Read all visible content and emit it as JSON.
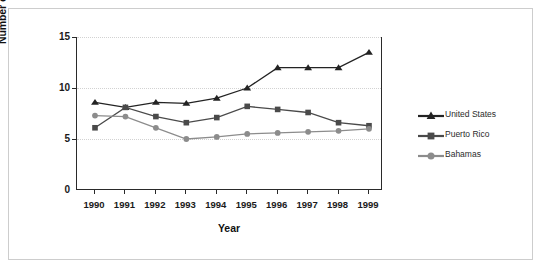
{
  "chart_data": {
    "type": "line",
    "title": "",
    "xlabel": "Year",
    "ylabel": "Number of tropical storms",
    "categories": [
      "1990",
      "1991",
      "1992",
      "1993",
      "1994",
      "1995",
      "1996",
      "1997",
      "1998",
      "1999"
    ],
    "x": [
      1990,
      1991,
      1992,
      1993,
      1994,
      1995,
      1996,
      1997,
      1998,
      1999
    ],
    "ylim": [
      0,
      15
    ],
    "yticks": [
      0,
      5,
      10,
      15
    ],
    "ytick_labels": [
      "0",
      "5",
      "10",
      "15"
    ],
    "grid": true,
    "grid_axis": "y",
    "legend_position": "right",
    "series": [
      {
        "name": "United States",
        "marker": "triangle",
        "color": "#232323",
        "values": [
          8.6,
          8.1,
          8.6,
          8.5,
          9.0,
          10.0,
          12.0,
          12.0,
          12.0,
          13.5
        ]
      },
      {
        "name": "Puerto Rico",
        "marker": "square",
        "color": "#4a4a4a",
        "values": [
          6.1,
          8.1,
          7.2,
          6.6,
          7.1,
          8.2,
          7.9,
          7.6,
          6.6,
          6.3
        ]
      },
      {
        "name": "Bahamas",
        "marker": "circle",
        "color": "#8c8c8c",
        "values": [
          7.3,
          7.2,
          6.1,
          5.0,
          5.2,
          5.5,
          5.6,
          5.7,
          5.8,
          6.0
        ]
      }
    ]
  },
  "legend": {
    "items": [
      {
        "label": "United States",
        "marker": "triangle",
        "color": "#232323"
      },
      {
        "label": "Puerto Rico",
        "marker": "square",
        "color": "#4a4a4a"
      },
      {
        "label": "Bahamas",
        "marker": "circle",
        "color": "#8c8c8c"
      }
    ]
  },
  "axes": {
    "y_title": "Number of tropical storms",
    "x_title": "Year"
  }
}
